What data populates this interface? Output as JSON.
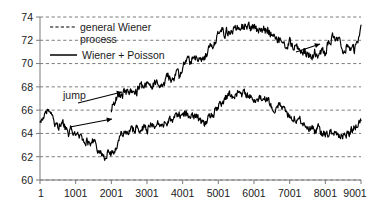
{
  "chart_data": {
    "type": "line",
    "title": "",
    "xlabel": "",
    "ylabel": "",
    "xlim": [
      1,
      9001
    ],
    "ylim": [
      60,
      74
    ],
    "grid": true,
    "grid_style": "dashed-horizontal",
    "legend_position": "upper-left-inside",
    "x_ticks": [
      1,
      1001,
      2001,
      3001,
      4001,
      5001,
      6001,
      7001,
      8001,
      9001
    ],
    "x_tick_labels": [
      "1",
      "1001",
      "2001",
      "3001",
      "4001",
      "5001",
      "6001",
      "7001",
      "8001",
      "9001"
    ],
    "y_ticks": [
      60,
      62,
      64,
      66,
      68,
      70,
      72,
      74
    ],
    "y_tick_labels": [
      "60",
      "62",
      "64",
      "66",
      "68",
      "70",
      "72",
      "74"
    ],
    "series": [
      {
        "name": "general Wiener process",
        "style": "dashed",
        "color": "#000000",
        "x": [
          1,
          101,
          201,
          301,
          401,
          501,
          601,
          701,
          801,
          901,
          1001,
          1101,
          1201,
          1301,
          1401,
          1501,
          1601,
          1701,
          1801,
          1901,
          2001,
          2101,
          2201,
          2301,
          2401,
          2501,
          2601,
          2701,
          2801,
          2901,
          3001,
          3101,
          3201,
          3301,
          3401,
          3501,
          3601,
          3701,
          3801,
          3901,
          4001,
          4101,
          4201,
          4301,
          4401,
          4501,
          4601,
          4701,
          4801,
          4901,
          5001,
          5101,
          5201,
          5301,
          5401,
          5501,
          5601,
          5701,
          5801,
          5901,
          6001,
          6101,
          6201,
          6301,
          6401,
          6501,
          6601,
          6701,
          6801,
          6901,
          7001,
          7101,
          7201,
          7301,
          7401,
          7501,
          7601,
          7701,
          7801,
          7901,
          8001,
          8101,
          8201,
          8301,
          8401,
          8501,
          8601,
          8701,
          8801,
          8901,
          9001
        ],
        "y": [
          64.8,
          65.3,
          65.9,
          65.4,
          64.9,
          64.6,
          65.0,
          64.5,
          64.1,
          64.5,
          64.0,
          63.6,
          63.2,
          63.4,
          63.1,
          63.3,
          62.8,
          62.3,
          62.0,
          62.4,
          62.3,
          62.6,
          63.3,
          64.0,
          64.2,
          64.4,
          64.2,
          64.5,
          64.3,
          64.6,
          64.4,
          64.7,
          64.5,
          64.8,
          65.0,
          64.9,
          65.2,
          65.0,
          65.3,
          65.5,
          65.3,
          65.6,
          65.4,
          65.5,
          65.3,
          65.0,
          64.8,
          65.2,
          65.6,
          66.0,
          66.4,
          66.8,
          67.0,
          67.4,
          67.2,
          67.5,
          67.3,
          67.4,
          67.2,
          67.3,
          67.0,
          67.2,
          66.9,
          67.1,
          66.7,
          66.4,
          66.2,
          66.5,
          66.1,
          65.8,
          65.5,
          65.2,
          65.4,
          65.0,
          64.6,
          64.3,
          64.5,
          64.2,
          64.4,
          64.0,
          63.8,
          64.1,
          63.9,
          64.2,
          63.9,
          63.7,
          63.9,
          64.2,
          64.5,
          64.8,
          65.1
        ],
        "description": "lower noisy path with jumps at ~1900 and ~2200"
      },
      {
        "name": "Wiener + Poisson",
        "style": "solid",
        "color": "#000000",
        "x": [
          2001,
          2101,
          2201,
          2301,
          2401,
          2501,
          2601,
          2701,
          2801,
          2901,
          3001,
          3101,
          3201,
          3301,
          3401,
          3501,
          3601,
          3701,
          3801,
          3901,
          4001,
          4101,
          4201,
          4301,
          4401,
          4501,
          4601,
          4701,
          4801,
          4901,
          5001,
          5101,
          5201,
          5301,
          5401,
          5501,
          5601,
          5701,
          5801,
          5901,
          6001,
          6101,
          6201,
          6301,
          6401,
          6501,
          6601,
          6701,
          6801,
          6901,
          7001,
          7101,
          7201,
          7301,
          7401,
          7501,
          7601,
          7701,
          7801,
          7901,
          8001,
          8101,
          8201,
          8301,
          8401,
          8501,
          8601,
          8701,
          8801,
          8901,
          9001
        ],
        "y": [
          66.0,
          66.6,
          67.4,
          67.2,
          67.6,
          67.4,
          67.8,
          67.6,
          68.0,
          67.8,
          68.2,
          68.0,
          68.4,
          68.2,
          68.6,
          68.4,
          68.8,
          68.6,
          69.0,
          68.8,
          69.2,
          70.4,
          70.2,
          70.6,
          70.4,
          70.8,
          70.6,
          71.0,
          71.3,
          71.8,
          72.4,
          72.8,
          72.6,
          73.0,
          72.8,
          73.2,
          73.4,
          73.1,
          73.3,
          73.0,
          73.2,
          72.9,
          73.1,
          72.8,
          73.0,
          72.6,
          72.3,
          72.0,
          71.7,
          71.4,
          71.8,
          71.5,
          71.2,
          70.9,
          71.2,
          70.8,
          70.6,
          71.0,
          70.5,
          71.2,
          70.8,
          72.0,
          72.3,
          72.0,
          71.6,
          71.3,
          71.6,
          71.3,
          71.0,
          71.6,
          73.3
        ],
        "description": "upper path starting after jumps, with jump at ~8050"
      }
    ],
    "legend": [
      {
        "label_line1": "general Wiener",
        "label_line2": "process",
        "style": "dashed"
      },
      {
        "label_line1": "Wiener + Poisson",
        "label_line2": "",
        "style": "solid"
      }
    ],
    "annotations": [
      {
        "text": "jump",
        "kind": "label-with-arrows",
        "arrow_count": 2,
        "target_x_approx": 2300
      },
      {
        "text": "",
        "kind": "arrow",
        "arrow_count": 1,
        "target_x_approx": 8050
      }
    ]
  }
}
